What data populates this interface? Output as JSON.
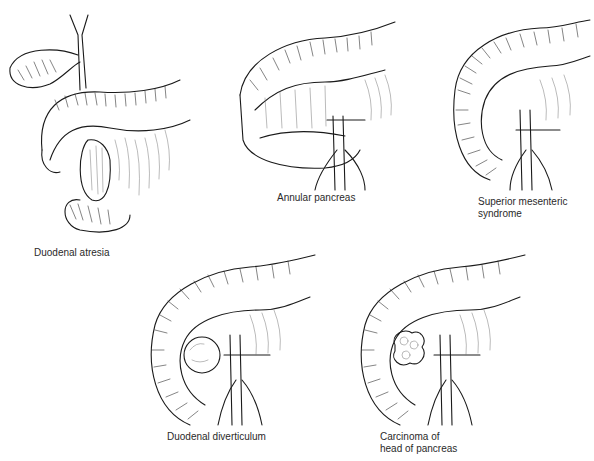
{
  "figure": {
    "panels": [
      {
        "id": "duodenal-atresia",
        "label": "Duodenal atresia"
      },
      {
        "id": "annular-pancreas",
        "label": "Annular pancreas"
      },
      {
        "id": "superior-mesenteric-syndrome",
        "label": "Superior mesenteric\nsyndrome"
      },
      {
        "id": "duodenal-diverticulum",
        "label": "Duodenal diverticulum"
      },
      {
        "id": "carcinoma-head-of-pancreas",
        "label": "Carcinoma of\nhead of pancreas"
      }
    ]
  }
}
